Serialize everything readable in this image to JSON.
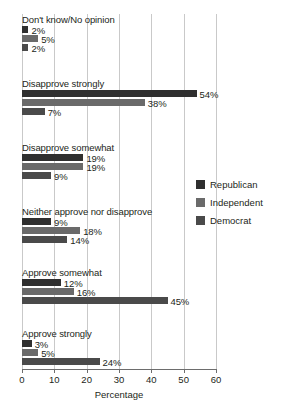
{
  "chart_data": {
    "type": "bar",
    "orientation": "horizontal",
    "title": "",
    "xlabel": "Percentage",
    "ylabel": "",
    "xlim": [
      0,
      60
    ],
    "xticks": [
      0,
      10,
      20,
      30,
      40,
      50,
      60
    ],
    "grid": true,
    "legend_position": "right",
    "value_suffix": "%",
    "categories": [
      "Don't know/No opinion",
      "Disapprove strongly",
      "Disapprove somewhat",
      "Neither approve nor disapprove",
      "Approve somewhat",
      "Approve strongly"
    ],
    "series": [
      {
        "name": "Republican",
        "color": "#2f2f2f",
        "values": [
          2,
          54,
          19,
          9,
          12,
          3
        ]
      },
      {
        "name": "Independent",
        "color": "#6a6a6a",
        "values": [
          5,
          38,
          19,
          18,
          16,
          5
        ]
      },
      {
        "name": "Democrat",
        "color": "#4a4a4a",
        "values": [
          2,
          7,
          9,
          14,
          45,
          24
        ]
      }
    ],
    "groups": [
      {
        "label": "Don't know/No opinion",
        "bars": [
          {
            "series": "Republican",
            "value": 2,
            "value_label": "2%"
          },
          {
            "series": "Independent",
            "value": 5,
            "value_label": "5%"
          },
          {
            "series": "Democrat",
            "value": 2,
            "value_label": "2%"
          }
        ]
      },
      {
        "label": "Disapprove strongly",
        "bars": [
          {
            "series": "Republican",
            "value": 54,
            "value_label": "54%"
          },
          {
            "series": "Independent",
            "value": 38,
            "value_label": "38%"
          },
          {
            "series": "Democrat",
            "value": 7,
            "value_label": "7%"
          }
        ]
      },
      {
        "label": "Disapprove somewhat",
        "bars": [
          {
            "series": "Republican",
            "value": 19,
            "value_label": "19%"
          },
          {
            "series": "Independent",
            "value": 19,
            "value_label": "19%"
          },
          {
            "series": "Democrat",
            "value": 9,
            "value_label": "9%"
          }
        ]
      },
      {
        "label": "Neither approve nor disapprove",
        "bars": [
          {
            "series": "Republican",
            "value": 9,
            "value_label": "9%"
          },
          {
            "series": "Independent",
            "value": 18,
            "value_label": "18%"
          },
          {
            "series": "Democrat",
            "value": 14,
            "value_label": "14%"
          }
        ]
      },
      {
        "label": "Approve somewhat",
        "bars": [
          {
            "series": "Republican",
            "value": 12,
            "value_label": "12%"
          },
          {
            "series": "Independent",
            "value": 16,
            "value_label": "16%"
          },
          {
            "series": "Democrat",
            "value": 45,
            "value_label": "45%"
          }
        ]
      },
      {
        "label": "Approve strongly",
        "bars": [
          {
            "series": "Republican",
            "value": 3,
            "value_label": "3%"
          },
          {
            "series": "Independent",
            "value": 5,
            "value_label": "5%"
          },
          {
            "series": "Democrat",
            "value": 24,
            "value_label": "24%"
          }
        ]
      }
    ],
    "tick_labels": [
      "0",
      "10",
      "20",
      "30",
      "40",
      "50",
      "60"
    ],
    "legend": [
      {
        "label": "Republican",
        "color": "#2f2f2f"
      },
      {
        "label": "Independent",
        "color": "#6a6a6a"
      },
      {
        "label": "Democrat",
        "color": "#4a4a4a"
      }
    ],
    "colors": {
      "grid": "#c9c9c9",
      "axis": "#6d6d6d",
      "text": "#231f20",
      "background": "#ffffff"
    }
  }
}
